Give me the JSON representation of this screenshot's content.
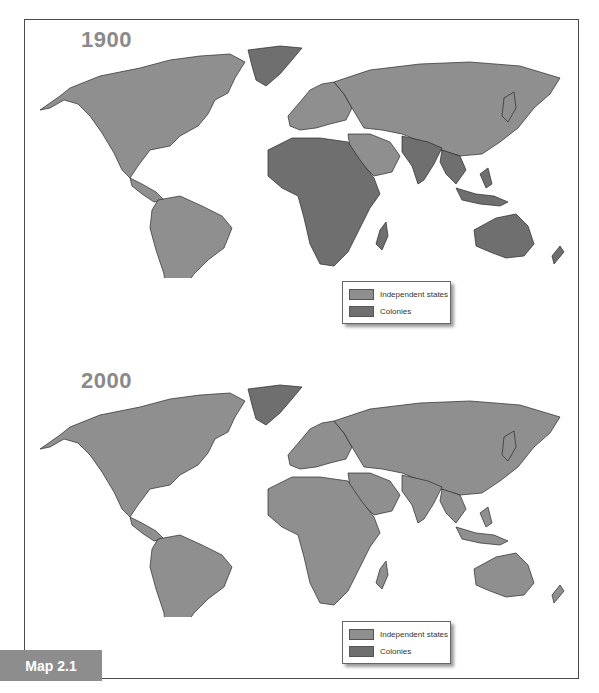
{
  "colors": {
    "independent": "#8f8f8f",
    "colony": "#6f6f6f",
    "border": "#2a2a2a",
    "year_label": "#8a8a8a",
    "tab_bg": "#8d8d8d"
  },
  "panels": [
    {
      "year": "1900",
      "legend": {
        "items": [
          {
            "label": "Independent states",
            "color": "#8f8f8f"
          },
          {
            "label": "Colonies",
            "color": "#6f6f6f"
          }
        ]
      },
      "regions": {
        "north_america": "independent",
        "greenland": "colony",
        "south_america": "independent",
        "europe": "independent",
        "russia_asia": "independent",
        "middle_east": "independent",
        "africa": "colony",
        "south_asia": "colony",
        "southeast_asia": "colony",
        "australia": "colony",
        "madagascar": "colony"
      }
    },
    {
      "year": "2000",
      "legend": {
        "items": [
          {
            "label": "Independent states",
            "color": "#8f8f8f"
          },
          {
            "label": "Colonies",
            "color": "#6f6f6f"
          }
        ]
      },
      "regions": {
        "north_america": "independent",
        "greenland": "colony",
        "south_america": "independent",
        "europe": "independent",
        "russia_asia": "independent",
        "middle_east": "independent",
        "africa": "independent",
        "south_asia": "independent",
        "southeast_asia": "independent",
        "australia": "independent",
        "madagascar": "independent"
      }
    }
  ],
  "caption": {
    "tab_label": "Map 2.1"
  }
}
